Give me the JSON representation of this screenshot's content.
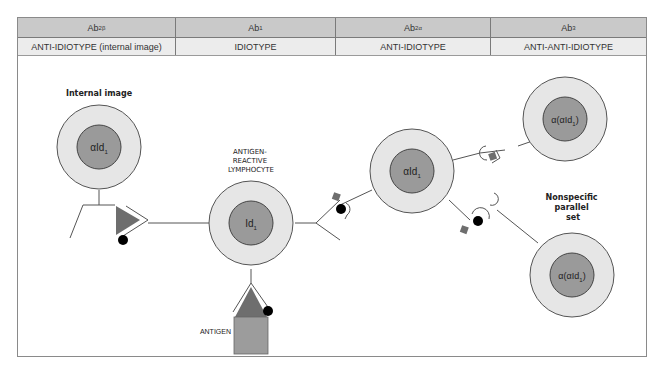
{
  "table": {
    "headers": [
      {
        "main": "Ab",
        "sub": "2β"
      },
      {
        "main": "Ab",
        "sub": "1"
      },
      {
        "main": "Ab",
        "sub": "2α"
      },
      {
        "main": "Ab",
        "sub": "3"
      }
    ],
    "descriptions": [
      "ANTI-IDIOTYPE (internal image)",
      "IDIOTYPE",
      "ANTI-IDIOTYPE",
      "ANTI-ANTI-IDIOTYPE"
    ]
  },
  "diagram": {
    "cells": [
      {
        "id": "internal-image",
        "title": "Internal image",
        "inner_label": "αId",
        "inner_sub": "1"
      },
      {
        "id": "antigen-reactive",
        "title_lines": [
          "ANTIGEN-",
          "REACTIVE",
          "LYMPHOCYTE"
        ],
        "inner_label": "Id",
        "inner_sub": "1"
      },
      {
        "id": "anti-idiotype",
        "inner_label": "αId",
        "inner_sub": "1"
      },
      {
        "id": "branch",
        "title": "Branch",
        "inner_label": "α(αId",
        "inner_sub": "1",
        "inner_suffix": ")"
      },
      {
        "id": "nonspecific",
        "title_lines": [
          "Nonspecific",
          "parallel",
          "set"
        ],
        "inner_label": "α(αId",
        "inner_sub": "1",
        "inner_suffix": ")"
      }
    ],
    "antigen_label": "ANTIGEN",
    "colors": {
      "outer_ring": "#e6e6e6",
      "inner_core": "#9a9a9a",
      "stroke": "#555555",
      "shape_dark": "#6e6e6e",
      "antigen_box": "#9c9c9c",
      "dot": "#000000"
    }
  }
}
